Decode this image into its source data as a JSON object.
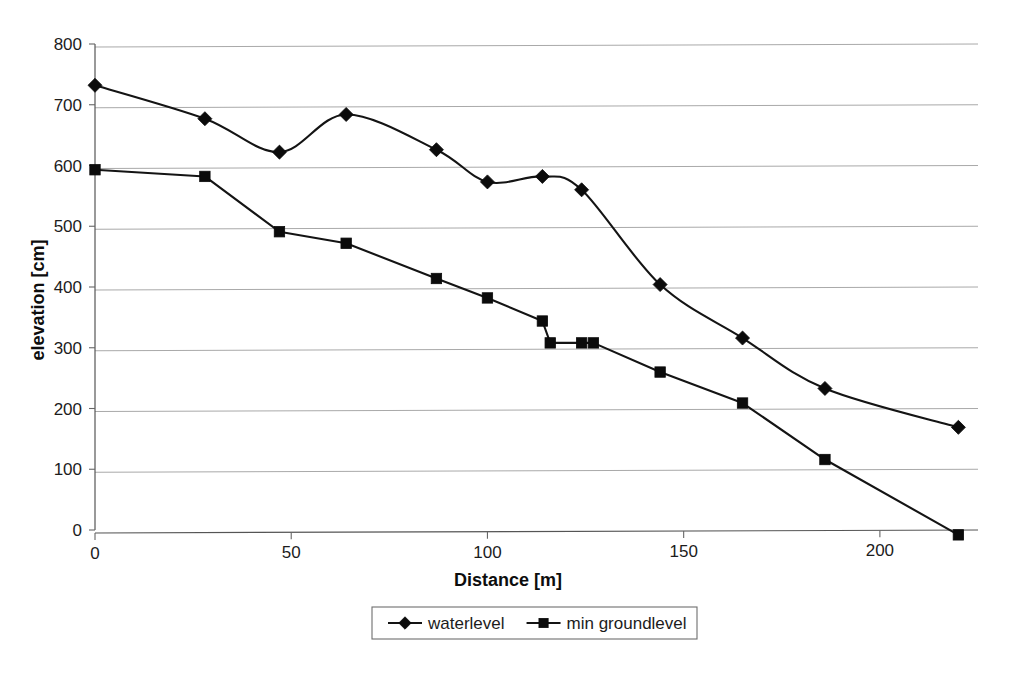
{
  "chart_data": {
    "type": "line",
    "title": "",
    "xlabel": "Distance [m]",
    "ylabel": "elevation [cm]",
    "xlim": [
      0,
      225
    ],
    "ylim": [
      0,
      800
    ],
    "xticks": [
      0,
      50,
      100,
      150,
      200
    ],
    "yticks": [
      0,
      100,
      200,
      300,
      400,
      500,
      600,
      700,
      800
    ],
    "xtick_labels": [
      "0",
      "50",
      "100",
      "150",
      "200"
    ],
    "ytick_labels": [
      "0",
      "100",
      "200",
      "300",
      "400",
      "500",
      "600",
      "700",
      "800"
    ],
    "grid": "horizontal",
    "legend_position": "bottom",
    "series": [
      {
        "name": "waterlevel",
        "marker": "diamond",
        "color": "#141414",
        "smooth": true,
        "points": [
          {
            "x": 0,
            "y": 732
          },
          {
            "x": 28,
            "y": 677
          },
          {
            "x": 47,
            "y": 622
          },
          {
            "x": 64,
            "y": 684
          },
          {
            "x": 87,
            "y": 626
          },
          {
            "x": 100,
            "y": 573
          },
          {
            "x": 114,
            "y": 582
          },
          {
            "x": 124,
            "y": 560
          },
          {
            "x": 144,
            "y": 404
          },
          {
            "x": 165,
            "y": 316
          },
          {
            "x": 186,
            "y": 233
          },
          {
            "x": 220,
            "y": 169
          }
        ]
      },
      {
        "name": "min groundlevel",
        "marker": "square",
        "color": "#141414",
        "smooth": false,
        "points": [
          {
            "x": 0,
            "y": 593
          },
          {
            "x": 28,
            "y": 582
          },
          {
            "x": 47,
            "y": 491
          },
          {
            "x": 64,
            "y": 472
          },
          {
            "x": 87,
            "y": 414
          },
          {
            "x": 100,
            "y": 382
          },
          {
            "x": 114,
            "y": 344
          },
          {
            "x": 116,
            "y": 308
          },
          {
            "x": 124,
            "y": 308
          },
          {
            "x": 127,
            "y": 308
          },
          {
            "x": 144,
            "y": 260
          },
          {
            "x": 165,
            "y": 209
          },
          {
            "x": 186,
            "y": 116
          },
          {
            "x": 220,
            "y": -8
          }
        ]
      }
    ]
  },
  "legend": {
    "items": [
      {
        "label": "waterlevel",
        "marker": "diamond"
      },
      {
        "label": "min groundlevel",
        "marker": "square"
      }
    ]
  },
  "axes": {
    "x_title": "Distance [m]",
    "y_title": "elevation [cm]"
  }
}
